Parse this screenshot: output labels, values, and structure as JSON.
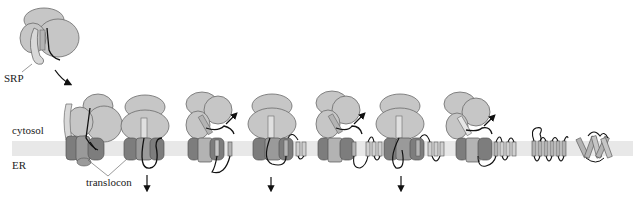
{
  "labels": {
    "srp": "SRP",
    "cytosol": "cytosol",
    "er": "ER",
    "translocon": "translocon"
  },
  "colors": {
    "ribosome": "#c6c6c6",
    "ribosome_stroke": "#6a6a6a",
    "translocon_dark": "#7d7d7d",
    "translocon_mid": "#9a9a9a",
    "helix": "#b3b3b3",
    "srp": "#d2d2d2",
    "membrane": "#e8e8e8",
    "chain": "#111111"
  },
  "diagram": {
    "stages": [
      {
        "index": 1,
        "description": "SRP bound to ribosome with signal sequence"
      },
      {
        "index": 2,
        "description": "Ribosome-SRP docks on translocon"
      },
      {
        "index": 3,
        "description": "Nascent chain translocated into ER lumen",
        "arrow": "down"
      },
      {
        "index": 4,
        "description": "First TM helix released laterally",
        "arrow": "up"
      },
      {
        "index": 5,
        "description": "Second TM hairpin inserted",
        "arrow": "down"
      },
      {
        "index": 6,
        "description": "Additional helices inserted",
        "arrow": "up"
      },
      {
        "index": 7,
        "description": "Further helix insertion",
        "arrow": "down"
      },
      {
        "index": 8,
        "description": "Final helix insertion",
        "arrow": "up"
      },
      {
        "index": 9,
        "description": "Released multi-spanning membrane protein"
      },
      {
        "index": 10,
        "description": "Folded helical bundle"
      }
    ]
  }
}
